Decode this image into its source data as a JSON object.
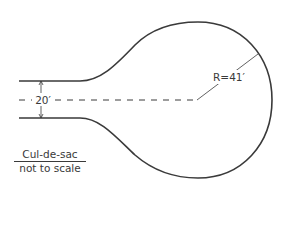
{
  "diagram": {
    "type": "road plan",
    "width_label": "20′",
    "radius_label": "R=41′",
    "caption_title": "Cul-de-sac",
    "caption_subtitle": "not to scale",
    "stroke_color": "#3a3a3a"
  }
}
